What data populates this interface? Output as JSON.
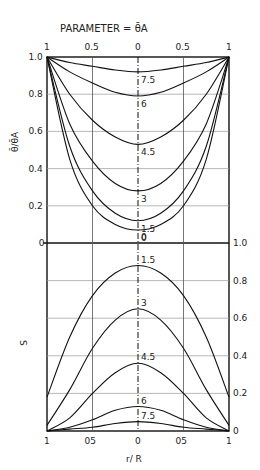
{
  "chart_data": [
    {
      "type": "line",
      "title": "PARAMETER = θ̄A",
      "xlabel": "r/R",
      "ylabel": "θ̄/θ̄A",
      "x_ticks": [
        "1",
        "0.5",
        "0",
        "0.5",
        "1"
      ],
      "y_ticks": [
        "0",
        "0.2",
        "0.4",
        "0.6",
        "0.8",
        "1.0"
      ],
      "ylim": [
        0,
        1.0
      ],
      "xlim": [
        -1,
        1
      ],
      "grid": true,
      "x": [
        -1,
        -0.75,
        -0.5,
        -0.25,
        0,
        0.25,
        0.5,
        0.75,
        1
      ],
      "series": [
        {
          "name": "7.5",
          "values": [
            1.0,
            0.97,
            0.95,
            0.93,
            0.92,
            0.93,
            0.95,
            0.97,
            1.0
          ]
        },
        {
          "name": "6",
          "values": [
            1.0,
            0.92,
            0.86,
            0.81,
            0.79,
            0.81,
            0.86,
            0.92,
            1.0
          ]
        },
        {
          "name": "4.5",
          "values": [
            1.0,
            0.8,
            0.66,
            0.57,
            0.53,
            0.57,
            0.66,
            0.8,
            1.0
          ]
        },
        {
          "name": "3",
          "values": [
            1.0,
            0.64,
            0.44,
            0.32,
            0.28,
            0.32,
            0.44,
            0.64,
            1.0
          ]
        },
        {
          "name": "1.5",
          "values": [
            1.0,
            0.52,
            0.28,
            0.16,
            0.12,
            0.16,
            0.28,
            0.52,
            1.0
          ]
        },
        {
          "name": "0",
          "values": [
            1.0,
            0.45,
            0.2,
            0.1,
            0.07,
            0.1,
            0.2,
            0.45,
            1.0
          ]
        }
      ],
      "annotations": [
        "7.5",
        "6",
        "4.5",
        "3",
        "1.5",
        "0"
      ]
    },
    {
      "type": "line",
      "title": "",
      "xlabel": "r/R",
      "ylabel": "S",
      "x_ticks": [
        "1",
        "0.5",
        "0",
        "0.5",
        "1"
      ],
      "y_ticks": [
        "0",
        "0.2",
        "0.4",
        "0.6",
        "0.8",
        "1.0"
      ],
      "ylim": [
        0,
        1.0
      ],
      "xlim": [
        -1,
        1
      ],
      "grid": true,
      "x": [
        -1,
        -0.75,
        -0.5,
        -0.25,
        0,
        0.25,
        0.5,
        0.75,
        1
      ],
      "series": [
        {
          "name": "0",
          "values": [
            1.0,
            1.0,
            1.0,
            1.0,
            1.0,
            1.0,
            1.0,
            1.0,
            1.0
          ]
        },
        {
          "name": "1.5",
          "values": [
            0.18,
            0.5,
            0.72,
            0.84,
            0.88,
            0.84,
            0.72,
            0.5,
            0.18
          ]
        },
        {
          "name": "3",
          "values": [
            0.03,
            0.22,
            0.44,
            0.59,
            0.65,
            0.59,
            0.44,
            0.22,
            0.03
          ]
        },
        {
          "name": "4.5",
          "values": [
            0.0,
            0.07,
            0.2,
            0.31,
            0.36,
            0.31,
            0.2,
            0.07,
            0.0
          ]
        },
        {
          "name": "6",
          "values": [
            0.0,
            0.02,
            0.06,
            0.11,
            0.13,
            0.11,
            0.06,
            0.02,
            0.0
          ]
        },
        {
          "name": "7.5",
          "values": [
            0.0,
            0.01,
            0.02,
            0.04,
            0.05,
            0.04,
            0.02,
            0.01,
            0.0
          ]
        }
      ],
      "annotations": [
        "1.5",
        "3",
        "4.5",
        "6",
        "7.5"
      ]
    }
  ],
  "labels": {
    "title": "PARAMETER = θ̄A",
    "top_ticks": [
      "1",
      "0.5",
      "0",
      "0.5",
      "1"
    ],
    "bottom_ticks": [
      "1",
      "05",
      "0",
      "05",
      "1"
    ],
    "left_ticks": [
      "1.0",
      "0.8",
      "0.6",
      "0.4",
      "0.2",
      "0"
    ],
    "right_ticks": [
      "1.0",
      "0.8",
      "0.6",
      "0.4",
      "0.2",
      "0"
    ],
    "upper_ylabel": "θ̄/θ̄A",
    "lower_ylabel": "S",
    "xlabel": "r/ R"
  }
}
